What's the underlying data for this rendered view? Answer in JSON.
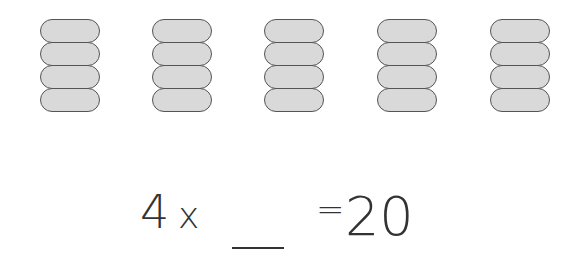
{
  "diagram": {
    "groups": [
      {
        "count": 4
      },
      {
        "count": 4
      },
      {
        "count": 4
      },
      {
        "count": 4
      },
      {
        "count": 4
      }
    ],
    "pill_fill": "#d9d9d9",
    "pill_stroke": "#555555"
  },
  "equation": {
    "factor": "4",
    "operator": "x",
    "blank": "___",
    "equals": "=",
    "product": "20"
  }
}
